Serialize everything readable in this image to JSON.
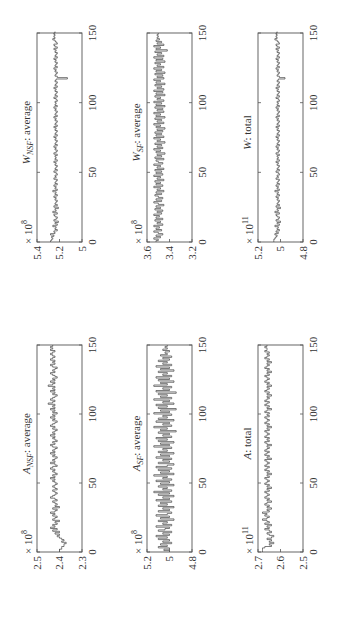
{
  "chart_data": [
    {
      "id": "A_NSF",
      "type": "line",
      "title": "A_NSF: average",
      "title_main": "A",
      "title_sub": "NSF",
      "title_rest": ": average",
      "xlabel": "",
      "ylabel": "",
      "xlim": [
        0,
        150
      ],
      "xticks": [
        0,
        50,
        100,
        150
      ],
      "ylim": [
        2.3,
        2.5
      ],
      "yticks": [
        "2.3",
        "2.4",
        "2.5"
      ],
      "yscale_label": "× 10^8",
      "exp": "8",
      "values": [
        2.4,
        2.4,
        2.39,
        2.39,
        2.38,
        2.38,
        2.37,
        2.39,
        2.38,
        2.39,
        2.4,
        2.41,
        2.4,
        2.42,
        2.4,
        2.43,
        2.41,
        2.44,
        2.42,
        2.43,
        2.41,
        2.42,
        2.4,
        2.43,
        2.42,
        2.41,
        2.43,
        2.42,
        2.44,
        2.42,
        2.41,
        2.43,
        2.4,
        2.42,
        2.41,
        2.42,
        2.43,
        2.41,
        2.42,
        2.44,
        2.43,
        2.42,
        2.41,
        2.42,
        2.43,
        2.41,
        2.42,
        2.43,
        2.42,
        2.41,
        2.42,
        2.43,
        2.42,
        2.44,
        2.42,
        2.43,
        2.41,
        2.42,
        2.43,
        2.42,
        2.44,
        2.43,
        2.41,
        2.42,
        2.44,
        2.42,
        2.43,
        2.42,
        2.41,
        2.43,
        2.42,
        2.44,
        2.42,
        2.43,
        2.42,
        2.41,
        2.43,
        2.44,
        2.42,
        2.43,
        2.41,
        2.42,
        2.43,
        2.42,
        2.44,
        2.42,
        2.43,
        2.42,
        2.41,
        2.43,
        2.42,
        2.44,
        2.43,
        2.42,
        2.41,
        2.43,
        2.42,
        2.44,
        2.42,
        2.43,
        2.41,
        2.43,
        2.42,
        2.44,
        2.42,
        2.43,
        2.42,
        2.45,
        2.43,
        2.42,
        2.44,
        2.43,
        2.42,
        2.41,
        2.43,
        2.42,
        2.44,
        2.42,
        2.43,
        2.42,
        2.45,
        2.43,
        2.42,
        2.44,
        2.42,
        2.43,
        2.41,
        2.42,
        2.43,
        2.44,
        2.42,
        2.43,
        2.42,
        2.41,
        2.43,
        2.44,
        2.42,
        2.43,
        2.42,
        2.44,
        2.43,
        2.42,
        2.43,
        2.44,
        2.43,
        2.42,
        2.44,
        2.43,
        2.44,
        2.43
      ]
    },
    {
      "id": "A_SF",
      "type": "line",
      "title": "A_SF: average",
      "title_main": "A",
      "title_sub": "SF",
      "title_rest": ": average",
      "xlabel": "",
      "ylabel": "",
      "xlim": [
        0,
        150
      ],
      "xticks": [
        0,
        50,
        100,
        150
      ],
      "ylim": [
        4.8,
        5.2
      ],
      "yticks": [
        "4.8",
        "5",
        "5.2"
      ],
      "yscale_label": "× 10^8",
      "exp": "8",
      "values": [
        5.0,
        5.05,
        5.0,
        5.1,
        5.02,
        5.08,
        4.98,
        5.06,
        5.0,
        5.1,
        5.02,
        5.12,
        5.0,
        5.06,
        4.98,
        5.1,
        5.04,
        5.0,
        5.12,
        4.98,
        5.06,
        5.02,
        5.1,
        4.96,
        5.08,
        5.0,
        5.12,
        5.02,
        4.98,
        5.1,
        5.0,
        5.06,
        4.96,
        5.1,
        5.02,
        5.08,
        4.98,
        5.12,
        5.0,
        5.06,
        4.96,
        5.1,
        5.0,
        5.14,
        4.98,
        5.06,
        5.02,
        5.1,
        4.96,
        5.08,
        5.0,
        5.12,
        4.98,
        5.06,
        5.02,
        5.14,
        4.96,
        5.08,
        5.0,
        5.1,
        4.98,
        5.12,
        5.02,
        4.96,
        5.1,
        5.0,
        5.06,
        4.98,
        5.12,
        5.0,
        5.08,
        4.96,
        5.1,
        5.02,
        5.06,
        4.98,
        5.14,
        5.0,
        5.08,
        4.96,
        5.1,
        5.02,
        5.12,
        4.98,
        5.06,
        5.0,
        5.1,
        4.94,
        5.08,
        5.02,
        5.14,
        4.98,
        5.06,
        5.0,
        5.12,
        4.96,
        5.1,
        5.02,
        5.06,
        4.98,
        5.14,
        5.0,
        5.08,
        4.94,
        5.1,
        5.02,
        5.12,
        4.96,
        5.06,
        5.0,
        5.14,
        4.98,
        5.08,
        5.02,
        5.1,
        4.94,
        5.12,
        5.0,
        5.06,
        4.98,
        5.14,
        5.02,
        5.08,
        4.96,
        5.1,
        5.0,
        5.12,
        4.98,
        5.06,
        5.02,
        5.1,
        4.96,
        5.08,
        5.0,
        5.12,
        4.98,
        5.06,
        5.02,
        5.1,
        5.0,
        5.06,
        4.98,
        5.08,
        5.02,
        5.04,
        5.0,
        5.06,
        5.02,
        5.04,
        5.02
      ]
    },
    {
      "id": "A_total",
      "type": "line",
      "title": "A: total",
      "title_main": "A",
      "title_sub": "",
      "title_rest": ": total",
      "xlabel": "",
      "ylabel": "",
      "xlim": [
        0,
        150
      ],
      "xticks": [
        0,
        50,
        100,
        150
      ],
      "ylim": [
        2.5,
        2.7
      ],
      "yticks": [
        "2.5",
        "2.6",
        "2.7"
      ],
      "yscale_label": "× 10^11",
      "exp": "11",
      "values": [
        2.68,
        2.68,
        2.68,
        2.67,
        2.64,
        2.65,
        2.63,
        2.65,
        2.64,
        2.66,
        2.64,
        2.63,
        2.65,
        2.66,
        2.64,
        2.65,
        2.67,
        2.65,
        2.66,
        2.64,
        2.67,
        2.65,
        2.66,
        2.68,
        2.66,
        2.65,
        2.67,
        2.66,
        2.68,
        2.65,
        2.66,
        2.64,
        2.66,
        2.65,
        2.67,
        2.66,
        2.64,
        2.66,
        2.65,
        2.67,
        2.66,
        2.65,
        2.66,
        2.67,
        2.65,
        2.66,
        2.64,
        2.66,
        2.65,
        2.67,
        2.66,
        2.65,
        2.66,
        2.67,
        2.65,
        2.66,
        2.64,
        2.66,
        2.65,
        2.67,
        2.66,
        2.65,
        2.67,
        2.66,
        2.65,
        2.66,
        2.67,
        2.64,
        2.66,
        2.65,
        2.67,
        2.66,
        2.65,
        2.67,
        2.66,
        2.65,
        2.66,
        2.64,
        2.66,
        2.67,
        2.65,
        2.66,
        2.65,
        2.67,
        2.66,
        2.65,
        2.66,
        2.67,
        2.65,
        2.66,
        2.64,
        2.66,
        2.65,
        2.67,
        2.66,
        2.65,
        2.66,
        2.67,
        2.65,
        2.66,
        2.65,
        2.67,
        2.66,
        2.64,
        2.66,
        2.65,
        2.67,
        2.66,
        2.65,
        2.67,
        2.66,
        2.65,
        2.66,
        2.64,
        2.66,
        2.65,
        2.67,
        2.66,
        2.65,
        2.66,
        2.64,
        2.66,
        2.65,
        2.67,
        2.66,
        2.65,
        2.66,
        2.67,
        2.65,
        2.66,
        2.64,
        2.66,
        2.65,
        2.67,
        2.66,
        2.65,
        2.66,
        2.64,
        2.66,
        2.65,
        2.67,
        2.66,
        2.65,
        2.66,
        2.65,
        2.67,
        2.66,
        2.66,
        2.67,
        2.66
      ]
    },
    {
      "id": "W_NSF",
      "type": "line",
      "title": "W_NSF: average",
      "title_main": "W",
      "title_sub": "NSF",
      "title_rest": ": average",
      "xlabel": "",
      "ylabel": "",
      "xlim": [
        0,
        150
      ],
      "xticks": [
        0,
        50,
        100,
        150
      ],
      "ylim": [
        5.0,
        5.4
      ],
      "yticks": [
        "5",
        "5.2",
        "5.4"
      ],
      "yscale_label": "× 10^8",
      "exp": "8",
      "values": [
        5.28,
        5.27,
        5.26,
        5.27,
        5.25,
        5.28,
        5.24,
        5.25,
        5.22,
        5.24,
        5.23,
        5.26,
        5.22,
        5.24,
        5.21,
        5.25,
        5.23,
        5.22,
        5.24,
        5.25,
        5.22,
        5.26,
        5.23,
        5.24,
        5.21,
        5.25,
        5.22,
        5.24,
        5.23,
        5.22,
        5.24,
        5.23,
        5.25,
        5.22,
        5.24,
        5.23,
        5.26,
        5.22,
        5.24,
        5.23,
        5.25,
        5.22,
        5.24,
        5.23,
        5.22,
        5.25,
        5.23,
        5.24,
        5.22,
        5.23,
        5.25,
        5.22,
        5.24,
        5.23,
        5.22,
        5.24,
        5.23,
        5.25,
        5.22,
        5.24,
        5.23,
        5.24,
        5.22,
        5.25,
        5.23,
        5.22,
        5.24,
        5.23,
        5.25,
        5.22,
        5.24,
        5.23,
        5.22,
        5.24,
        5.23,
        5.25,
        5.22,
        5.24,
        5.23,
        5.22,
        5.24,
        5.23,
        5.25,
        5.22,
        5.24,
        5.23,
        5.22,
        5.24,
        5.23,
        5.25,
        5.22,
        5.24,
        5.23,
        5.22,
        5.24,
        5.23,
        5.25,
        5.22,
        5.24,
        5.23,
        5.24,
        5.22,
        5.23,
        5.25,
        5.22,
        5.24,
        5.23,
        5.22,
        5.24,
        5.23,
        5.25,
        5.22,
        5.24,
        5.23,
        5.22,
        5.24,
        5.23,
        5.13,
        5.22,
        5.24,
        5.23,
        5.22,
        5.24,
        5.23,
        5.25,
        5.22,
        5.24,
        5.23,
        5.22,
        5.24,
        5.23,
        5.25,
        5.22,
        5.24,
        5.23,
        5.22,
        5.24,
        5.23,
        5.25,
        5.22,
        5.24,
        5.25,
        5.22,
        5.23,
        5.24,
        5.26,
        5.24,
        5.25,
        5.24,
        5.25,
        5.24
      ]
    },
    {
      "id": "W_SF",
      "type": "line",
      "title": "W_SF: average",
      "title_main": "W",
      "title_sub": "SF",
      "title_rest": ": average",
      "xlabel": "",
      "ylabel": "",
      "xlim": [
        0,
        150
      ],
      "xticks": [
        0,
        50,
        100,
        150
      ],
      "ylim": [
        3.2,
        3.6
      ],
      "yticks": [
        "3.2",
        "3.4",
        "3.6"
      ],
      "yscale_label": "× 10^8",
      "exp": "8",
      "values": [
        3.52,
        3.5,
        3.54,
        3.48,
        3.52,
        3.46,
        3.5,
        3.54,
        3.47,
        3.52,
        3.49,
        3.54,
        3.46,
        3.51,
        3.48,
        3.53,
        3.46,
        3.52,
        3.49,
        3.54,
        3.47,
        3.51,
        3.46,
        3.53,
        3.48,
        3.52,
        3.45,
        3.5,
        3.54,
        3.47,
        3.52,
        3.46,
        3.5,
        3.53,
        3.47,
        3.52,
        3.45,
        3.51,
        3.48,
        3.54,
        3.46,
        3.52,
        3.48,
        3.53,
        3.45,
        3.51,
        3.48,
        3.54,
        3.46,
        3.52,
        3.47,
        3.53,
        3.45,
        3.51,
        3.48,
        3.54,
        3.46,
        3.5,
        3.52,
        3.45,
        3.53,
        3.47,
        3.51,
        3.44,
        3.52,
        3.48,
        3.54,
        3.46,
        3.51,
        3.47,
        3.53,
        3.44,
        3.51,
        3.48,
        3.54,
        3.45,
        3.52,
        3.47,
        3.53,
        3.46,
        3.51,
        3.44,
        3.52,
        3.48,
        3.54,
        3.45,
        3.51,
        3.47,
        3.53,
        3.44,
        3.52,
        3.48,
        3.54,
        3.45,
        3.51,
        3.46,
        3.53,
        3.44,
        3.52,
        3.47,
        3.54,
        3.45,
        3.51,
        3.48,
        3.53,
        3.44,
        3.52,
        3.46,
        3.54,
        3.45,
        3.51,
        3.47,
        3.53,
        3.44,
        3.52,
        3.48,
        3.54,
        3.45,
        3.51,
        3.46,
        3.53,
        3.44,
        3.52,
        3.47,
        3.54,
        3.45,
        3.51,
        3.48,
        3.53,
        3.44,
        3.52,
        3.46,
        3.54,
        3.45,
        3.51,
        3.47,
        3.53,
        3.42,
        3.52,
        3.48,
        3.54,
        3.45,
        3.51,
        3.47,
        3.52,
        3.49,
        3.51,
        3.5,
        3.51,
        3.5
      ]
    },
    {
      "id": "W_total",
      "type": "line",
      "title": "W: total",
      "title_main": "W",
      "title_sub": "",
      "title_rest": ": total",
      "xlabel": "",
      "ylabel": "",
      "xlim": [
        0,
        150
      ],
      "xticks": [
        0,
        50,
        100,
        150
      ],
      "ylim": [
        4.8,
        5.2
      ],
      "yticks": [
        "4.8",
        "5",
        "5.2"
      ],
      "yscale_label": "× 10^11",
      "exp": "11",
      "values": [
        5.06,
        5.06,
        5.05,
        5.04,
        5.03,
        5.05,
        5.02,
        5.04,
        5.01,
        5.03,
        5.02,
        5.05,
        5.01,
        5.03,
        5.0,
        5.04,
        5.02,
        5.01,
        5.03,
        5.04,
        5.01,
        5.05,
        5.02,
        5.03,
        5.0,
        5.04,
        5.01,
        5.03,
        5.02,
        5.01,
        5.03,
        5.02,
        5.04,
        5.01,
        5.03,
        5.02,
        5.05,
        5.01,
        5.03,
        5.02,
        5.04,
        5.01,
        5.03,
        5.02,
        5.01,
        5.04,
        5.02,
        5.03,
        5.01,
        5.02,
        5.04,
        5.01,
        5.03,
        5.02,
        5.01,
        5.03,
        5.02,
        5.04,
        5.01,
        5.03,
        5.02,
        5.03,
        5.01,
        5.04,
        5.02,
        5.01,
        5.03,
        5.02,
        5.04,
        5.01,
        5.03,
        5.02,
        5.01,
        5.03,
        5.02,
        5.04,
        5.01,
        5.03,
        5.02,
        5.01,
        5.03,
        5.02,
        5.04,
        5.01,
        5.03,
        5.02,
        5.01,
        5.03,
        5.02,
        5.04,
        5.01,
        5.03,
        5.02,
        5.01,
        5.03,
        5.02,
        5.04,
        5.01,
        5.03,
        5.02,
        5.03,
        5.01,
        5.02,
        5.04,
        5.01,
        5.03,
        5.02,
        5.01,
        5.03,
        5.02,
        5.04,
        5.01,
        5.03,
        5.02,
        5.01,
        5.03,
        5.02,
        4.96,
        5.01,
        5.03,
        5.02,
        5.01,
        5.03,
        5.02,
        5.04,
        5.01,
        5.03,
        5.02,
        5.01,
        5.03,
        5.02,
        5.04,
        5.01,
        5.03,
        5.02,
        5.01,
        5.03,
        5.02,
        5.04,
        5.01,
        5.03,
        5.04,
        5.01,
        5.02,
        5.03,
        5.05,
        5.03,
        5.04,
        5.03,
        5.04,
        5.03
      ]
    }
  ],
  "layout": {
    "orientation": "rotated-90-ccw",
    "grid": false,
    "legend": "none"
  }
}
